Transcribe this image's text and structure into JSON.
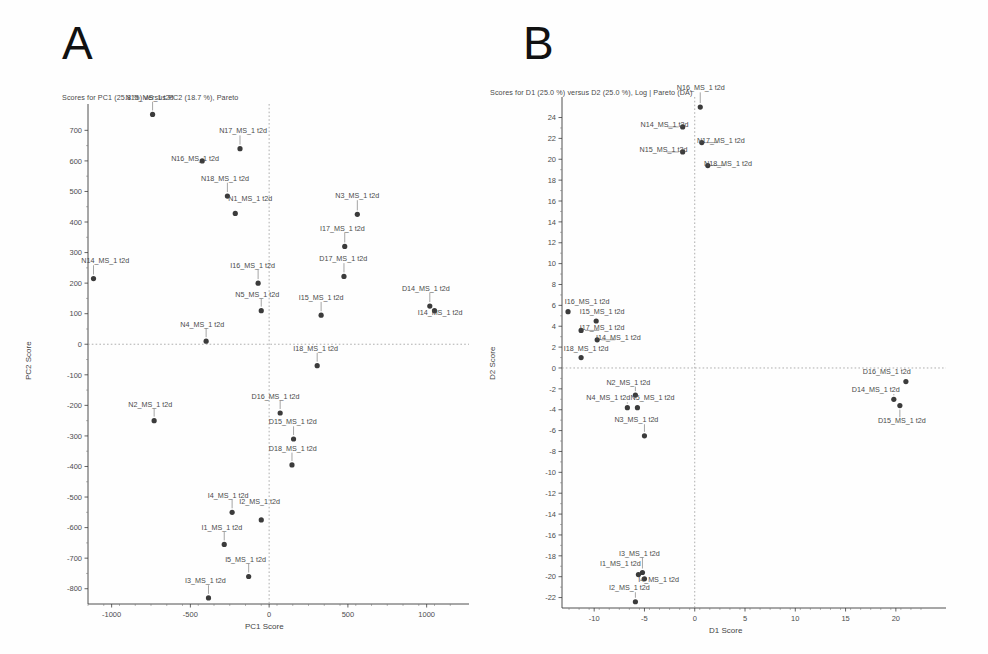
{
  "figure": {
    "panels": [
      {
        "letter": "A",
        "id": "panel-a"
      },
      {
        "letter": "B",
        "id": "panel-b"
      }
    ]
  },
  "chart_data": [
    {
      "type": "scatter",
      "panel": "A",
      "title": "Scores for PC1 (25.8 %) versus PC2 (18.7 %), Pareto",
      "xlabel": "PC1 Score",
      "ylabel": "PC2 Score",
      "xlim": [
        -1150,
        1180
      ],
      "ylim": [
        -850,
        760
      ],
      "xticks": [
        -1000,
        -500,
        0,
        500,
        1000
      ],
      "xticklabels": [
        "-1000",
        "-500",
        "0",
        "500",
        "1000"
      ],
      "yticks": [
        -800,
        -700,
        -600,
        -500,
        -400,
        -300,
        -200,
        -100,
        0,
        100,
        200,
        300,
        400,
        500,
        600,
        700
      ],
      "yticklabels": [
        "-800",
        "-700",
        "-600",
        "-500",
        "-400",
        "-300",
        "-200",
        "-100",
        "0",
        "100",
        "200",
        "300",
        "400",
        "500",
        "600",
        "700"
      ],
      "grid": false,
      "zero_lines": true,
      "points": [
        {
          "label": "N15_MS_1 t2d",
          "x": -740,
          "y": 752,
          "lx": -760,
          "ly": 800,
          "anchor": "middle",
          "leader": "down"
        },
        {
          "label": "N17_MS_1 t2d",
          "x": -185,
          "y": 640,
          "lx": -165,
          "ly": 690,
          "anchor": "middle",
          "leader": "down"
        },
        {
          "label": "N16_MS_1 t2d",
          "x": -425,
          "y": 600,
          "lx": -470,
          "ly": 600,
          "anchor": "middle",
          "leader": "right"
        },
        {
          "label": "N18_MS_1 t2d",
          "x": -265,
          "y": 485,
          "lx": -280,
          "ly": 535,
          "anchor": "middle",
          "leader": "down"
        },
        {
          "label": "N1_MS_1 t2d",
          "x": -215,
          "y": 428,
          "lx": -120,
          "ly": 470,
          "anchor": "middle",
          "leader": "none"
        },
        {
          "label": "N3_MS_1 t2d",
          "x": 560,
          "y": 425,
          "lx": 560,
          "ly": 478,
          "anchor": "middle",
          "leader": "down"
        },
        {
          "label": "I17_MS_1 t2d",
          "x": 480,
          "y": 320,
          "lx": 465,
          "ly": 372,
          "anchor": "middle",
          "leader": "down"
        },
        {
          "label": "D17_MS_1 t2d",
          "x": 475,
          "y": 222,
          "lx": 470,
          "ly": 272,
          "anchor": "middle",
          "leader": "down"
        },
        {
          "label": "N14_MS_1 t2d",
          "x": -1115,
          "y": 215,
          "lx": -1040,
          "ly": 265,
          "anchor": "middle",
          "leader": "down"
        },
        {
          "label": "I16_MS_1 t2d",
          "x": -70,
          "y": 200,
          "lx": -105,
          "ly": 250,
          "anchor": "middle",
          "leader": "down"
        },
        {
          "label": "D14_MS_1 t2d",
          "x": 1020,
          "y": 125,
          "lx": 995,
          "ly": 175,
          "anchor": "middle",
          "leader": "down"
        },
        {
          "label": "I14_MS_1 t2d",
          "x": 1050,
          "y": 110,
          "lx": 1085,
          "ly": 95,
          "anchor": "middle",
          "leader": "none"
        },
        {
          "label": "N5_MS_1 t2d",
          "x": -50,
          "y": 110,
          "lx": -75,
          "ly": 155,
          "anchor": "middle",
          "leader": "down"
        },
        {
          "label": "I15_MS_1 t2d",
          "x": 330,
          "y": 95,
          "lx": 330,
          "ly": 145,
          "anchor": "middle",
          "leader": "down"
        },
        {
          "label": "N4_MS_1 t2d",
          "x": -400,
          "y": 10,
          "lx": -425,
          "ly": 58,
          "anchor": "middle",
          "leader": "down"
        },
        {
          "label": "I18_MS_1 t2d",
          "x": 305,
          "y": -70,
          "lx": 295,
          "ly": -22,
          "anchor": "middle",
          "leader": "down"
        },
        {
          "label": "D16_MS_1 t2d",
          "x": 70,
          "y": -225,
          "lx": 40,
          "ly": -178,
          "anchor": "middle",
          "leader": "down"
        },
        {
          "label": "N2_MS_1 t2d",
          "x": -730,
          "y": -250,
          "lx": -755,
          "ly": -205,
          "anchor": "middle",
          "leader": "down"
        },
        {
          "label": "D15_MS_1 t2d",
          "x": 155,
          "y": -310,
          "lx": 150,
          "ly": -262,
          "anchor": "middle",
          "leader": "down"
        },
        {
          "label": "D18_MS_1 t2d",
          "x": 145,
          "y": -395,
          "lx": 150,
          "ly": -348,
          "anchor": "middle",
          "leader": "down"
        },
        {
          "label": "I4_MS_1 t2d",
          "x": -235,
          "y": -550,
          "lx": -260,
          "ly": -502,
          "anchor": "middle",
          "leader": "down"
        },
        {
          "label": "I2_MS_1 t2d",
          "x": -50,
          "y": -575,
          "lx": -60,
          "ly": -523,
          "anchor": "middle",
          "leader": "none"
        },
        {
          "label": "I1_MS_1 t2d",
          "x": -285,
          "y": -655,
          "lx": -300,
          "ly": -608,
          "anchor": "middle",
          "leader": "down"
        },
        {
          "label": "I5_MS_1 t2d",
          "x": -130,
          "y": -760,
          "lx": -150,
          "ly": -712,
          "anchor": "middle",
          "leader": "down"
        },
        {
          "label": "I3_MS_1 t2d",
          "x": -385,
          "y": -830,
          "lx": -405,
          "ly": -782,
          "anchor": "middle",
          "leader": "down"
        }
      ]
    },
    {
      "type": "scatter",
      "panel": "B",
      "title": "Scores for D1 (25.0 %) versus D2 (25.0 %), Log | Pareto (DA)",
      "xlabel": "D1 Score",
      "ylabel": "D2 Score",
      "xlim": [
        -13.2,
        22.8
      ],
      "ylim": [
        -23.0,
        25.2
      ],
      "xticks": [
        -10,
        -5,
        0,
        5,
        10,
        15,
        20
      ],
      "xticklabels": [
        "-10",
        "-5",
        "0",
        "5",
        "10",
        "15",
        "20"
      ],
      "yticks": [
        -22,
        -20,
        -18,
        -16,
        -14,
        -12,
        -10,
        -8,
        -6,
        -4,
        -2,
        0,
        2,
        4,
        6,
        8,
        10,
        12,
        14,
        16,
        18,
        20,
        22,
        24
      ],
      "yticklabels": [
        "-22",
        "-20",
        "-18",
        "-16",
        "-14",
        "-12",
        "-10",
        "-8",
        "-6",
        "-4",
        "-2",
        "0",
        "2",
        "4",
        "6",
        "8",
        "10",
        "12",
        "14",
        "16",
        "18",
        "20",
        "22",
        "24"
      ],
      "grid": false,
      "zero_lines": true,
      "points": [
        {
          "label": "N16_MS_1 t2d",
          "x": 0.55,
          "y": 25.0,
          "lx": 0.6,
          "ly": 26.6,
          "anchor": "middle",
          "leader": "down"
        },
        {
          "label": "N14_MS_1 t2d",
          "x": -1.2,
          "y": 23.1,
          "lx": -3.0,
          "ly": 23.1,
          "anchor": "middle",
          "leader": "right"
        },
        {
          "label": "N17_MS_1 t2d",
          "x": 0.7,
          "y": 21.6,
          "lx": 2.6,
          "ly": 21.6,
          "anchor": "middle",
          "leader": "left"
        },
        {
          "label": "N15_MS_1 t2d",
          "x": -1.2,
          "y": 20.7,
          "lx": -3.1,
          "ly": 20.7,
          "anchor": "middle",
          "leader": "right"
        },
        {
          "label": "N18_MS_1 t2d",
          "x": 1.3,
          "y": 19.4,
          "lx": 3.3,
          "ly": 19.4,
          "anchor": "middle",
          "leader": "left"
        },
        {
          "label": "I16_MS_1 t2d",
          "x": -12.6,
          "y": 5.4,
          "lx": -10.7,
          "ly": 6.1,
          "anchor": "middle",
          "leader": "none"
        },
        {
          "label": "I15_MS_1 t2d",
          "x": -9.8,
          "y": 4.5,
          "lx": -9.2,
          "ly": 5.2,
          "anchor": "middle",
          "leader": "none"
        },
        {
          "label": "I17_MS_1 t2d",
          "x": -11.3,
          "y": 3.6,
          "lx": -9.2,
          "ly": 3.6,
          "anchor": "middle",
          "leader": "left"
        },
        {
          "label": "I14_MS_1 t2d",
          "x": -9.7,
          "y": 2.7,
          "lx": -7.6,
          "ly": 2.7,
          "anchor": "middle",
          "leader": "left"
        },
        {
          "label": "I18_MS_1 t2d",
          "x": -11.3,
          "y": 1.0,
          "lx": -10.8,
          "ly": 1.6,
          "anchor": "middle",
          "leader": "none"
        },
        {
          "label": "D16_MS_1 t2d",
          "x": 21.0,
          "y": -1.3,
          "lx": 19.1,
          "ly": -0.6,
          "anchor": "middle",
          "leader": "none"
        },
        {
          "label": "N2_MS_1 t2d",
          "x": -5.9,
          "y": -2.6,
          "lx": -6.6,
          "ly": -1.6,
          "anchor": "middle",
          "leader": "down"
        },
        {
          "label": "D14_MS_1 t2d",
          "x": 19.8,
          "y": -3.0,
          "lx": 18.0,
          "ly": -2.3,
          "anchor": "middle",
          "leader": "down"
        },
        {
          "label": "N4_MS_1 t2d",
          "x": -6.7,
          "y": -3.8,
          "lx": -8.6,
          "ly": -3.1,
          "anchor": "middle",
          "leader": "down"
        },
        {
          "label": "N5_MS_1 t2d",
          "x": -5.7,
          "y": -3.8,
          "lx": -4.2,
          "ly": -3.1,
          "anchor": "middle",
          "leader": "none"
        },
        {
          "label": "D15_MS_1 t2d",
          "x": 20.4,
          "y": -3.6,
          "lx": 20.6,
          "ly": -5.3,
          "anchor": "middle",
          "leader": "up"
        },
        {
          "label": "N3_MS_1 t2d",
          "x": -5.0,
          "y": -6.5,
          "lx": -5.8,
          "ly": -5.2,
          "anchor": "middle",
          "leader": "down"
        },
        {
          "label": "I3_MS_1 t2d",
          "x": -5.2,
          "y": -19.6,
          "lx": -5.5,
          "ly": -18.0,
          "anchor": "middle",
          "leader": "down"
        },
        {
          "label": "I1_MS_1 t2d",
          "x": -5.6,
          "y": -19.8,
          "lx": -7.4,
          "ly": -19.0,
          "anchor": "middle",
          "leader": "none"
        },
        {
          "label": "I4_MS_1 t2d",
          "x": -5.0,
          "y": -20.2,
          "lx": -3.6,
          "ly": -20.5,
          "anchor": "middle",
          "leader": "none"
        },
        {
          "label": "I2_MS_1 t2d",
          "x": -5.9,
          "y": -22.4,
          "lx": -6.5,
          "ly": -21.3,
          "anchor": "middle",
          "leader": "down"
        }
      ]
    }
  ]
}
